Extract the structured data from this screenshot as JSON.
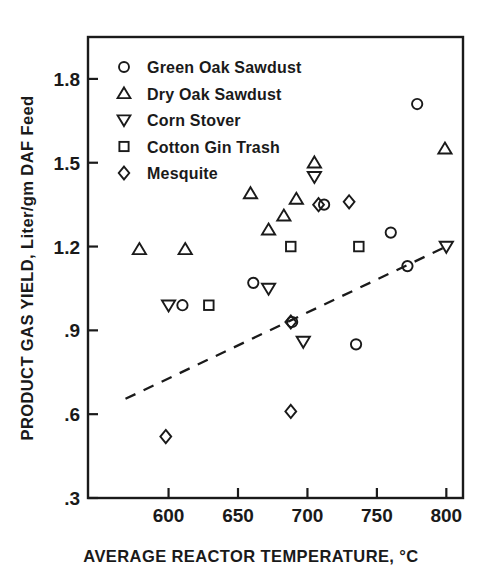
{
  "chart_data": {
    "type": "scatter",
    "title": "",
    "xlabel": "AVERAGE REACTOR TEMPERATURE, °C",
    "ylabel": "PRODUCT GAS YIELD, Liter/gm DAF Feed",
    "xlim": [
      542,
      812
    ],
    "ylim": [
      0.3,
      1.95
    ],
    "xticks": [
      600,
      650,
      700,
      750,
      800
    ],
    "xticklabels": [
      "600",
      "650",
      "700",
      "750",
      "800"
    ],
    "yticks": [
      0.3,
      0.6,
      0.9,
      1.2,
      1.5,
      1.8
    ],
    "yticklabels": [
      ".3",
      ".6",
      ".9",
      "1.2",
      "1.5",
      "1.8"
    ],
    "grid": false,
    "legend_position": "upper-left-inside",
    "marker_color": "#1a1a1a",
    "series": [
      {
        "name": "Green Oak Sawdust",
        "marker": "circle",
        "points": [
          {
            "x": 610,
            "y": 0.99
          },
          {
            "x": 661,
            "y": 1.07
          },
          {
            "x": 689,
            "y": 0.93
          },
          {
            "x": 712,
            "y": 1.35
          },
          {
            "x": 735,
            "y": 0.85
          },
          {
            "x": 760,
            "y": 1.25
          },
          {
            "x": 772,
            "y": 1.13
          },
          {
            "x": 779,
            "y": 1.71
          }
        ]
      },
      {
        "name": "Dry Oak Sawdust",
        "marker": "triangle-up",
        "points": [
          {
            "x": 579,
            "y": 1.19
          },
          {
            "x": 612,
            "y": 1.19
          },
          {
            "x": 659,
            "y": 1.39
          },
          {
            "x": 672,
            "y": 1.26
          },
          {
            "x": 683,
            "y": 1.31
          },
          {
            "x": 692,
            "y": 1.37
          },
          {
            "x": 705,
            "y": 1.5
          },
          {
            "x": 799,
            "y": 1.55
          }
        ]
      },
      {
        "name": "Corn Stover",
        "marker": "triangle-down",
        "points": [
          {
            "x": 600,
            "y": 0.99
          },
          {
            "x": 672,
            "y": 1.05
          },
          {
            "x": 697,
            "y": 0.86
          },
          {
            "x": 705,
            "y": 1.45
          },
          {
            "x": 800,
            "y": 1.2
          }
        ]
      },
      {
        "name": "Cotton Gin Trash",
        "marker": "square",
        "points": [
          {
            "x": 629,
            "y": 0.99
          },
          {
            "x": 688,
            "y": 1.2
          },
          {
            "x": 737,
            "y": 1.2
          }
        ]
      },
      {
        "name": "Mesquite",
        "marker": "diamond",
        "points": [
          {
            "x": 598,
            "y": 0.52
          },
          {
            "x": 688,
            "y": 0.61
          },
          {
            "x": 688,
            "y": 0.93
          },
          {
            "x": 708,
            "y": 1.35
          },
          {
            "x": 730,
            "y": 1.36
          }
        ]
      }
    ],
    "trendline": {
      "style": "dashed",
      "x0": 569,
      "y0": 0.655,
      "x1": 800,
      "y1": 1.2
    }
  }
}
